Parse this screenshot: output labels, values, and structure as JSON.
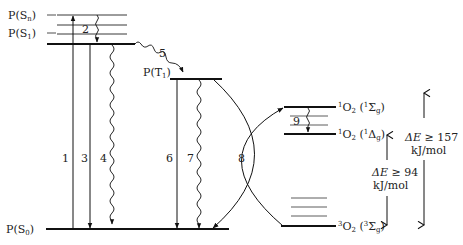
{
  "diagram": {
    "type": "Jablonski energy-level diagram (photosensitizer and oxygen)",
    "photosensitizer_states": [
      {
        "id": "Sn",
        "label": "P(S",
        "sub": "n",
        "close": ")"
      },
      {
        "id": "S1",
        "label": "P(S",
        "sub": "1",
        "close": ")"
      },
      {
        "id": "T1",
        "label": "P(T",
        "sub": "1",
        "close": ")"
      },
      {
        "id": "S0",
        "label": "P(S",
        "sub": "0",
        "close": ")"
      }
    ],
    "oxygen_states": [
      {
        "id": "1Sg",
        "pre_sup": "1",
        "mol": "O",
        "mol_sub": "2",
        "term_open": " (",
        "term_sup": "1",
        "term": "Σ",
        "term_sub": "g",
        "term_close": ")"
      },
      {
        "id": "1Dg",
        "pre_sup": "1",
        "mol": "O",
        "mol_sub": "2",
        "term_open": " (",
        "term_sup": "1",
        "term": "Δ",
        "term_sub": "g",
        "term_close": ")"
      },
      {
        "id": "3Sg",
        "pre_sup": "3",
        "mol": "O",
        "mol_sub": "2",
        "term_open": " (",
        "term_sup": "3",
        "term": "Σ",
        "term_sub": "g",
        "term_close": ")"
      }
    ],
    "transitions": [
      {
        "n": "1",
        "desc": "absorption S0 to Sn"
      },
      {
        "n": "2",
        "desc": "internal conversion Sn to S1"
      },
      {
        "n": "3",
        "desc": "fluorescence S1 to S0"
      },
      {
        "n": "4",
        "desc": "internal conversion S1 to S0"
      },
      {
        "n": "5",
        "desc": "intersystem crossing S1 to T1"
      },
      {
        "n": "6",
        "desc": "phosphorescence T1 to S0"
      },
      {
        "n": "7",
        "desc": "intersystem crossing T1 to S0"
      },
      {
        "n": "8",
        "desc": "energy transfer T1 to O2"
      },
      {
        "n": "9",
        "desc": "relaxation 1Σg to 1Δg"
      }
    ],
    "energy_gaps": [
      {
        "delta": "ΔE",
        "rel": " ≥ 94",
        "unit": "kJ/mol"
      },
      {
        "delta": "ΔE",
        "rel": " ≥ 157",
        "unit": "kJ/mol"
      }
    ]
  }
}
